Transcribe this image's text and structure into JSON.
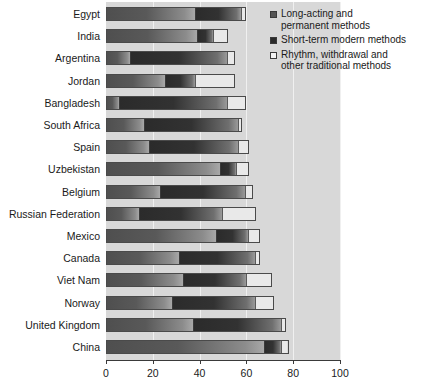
{
  "chart_data": {
    "type": "bar",
    "orientation": "horizontal",
    "stacked": true,
    "title": "",
    "xlabel": "",
    "ylabel": "",
    "xlim": [
      0,
      100
    ],
    "xticks": [
      0,
      20,
      40,
      60,
      80,
      100
    ],
    "xtick_labels": [
      "0",
      "20",
      "40",
      "60",
      "80",
      "100"
    ],
    "grid": true,
    "legend_position": "top-right",
    "categories": [
      "Egypt",
      "India",
      "Argentina",
      "Jordan",
      "Bangladesh",
      "South Africa",
      "Spain",
      "Uzbekistan",
      "Belgium",
      "Russian Federation",
      "Mexico",
      "Canada",
      "Viet Nam",
      "Norway",
      "United Kingdom",
      "China"
    ],
    "series": [
      {
        "name": "Long-acting and permanent methods",
        "color": "#555555",
        "values": [
          38,
          39,
          10,
          25,
          5,
          16,
          18,
          49,
          23,
          14,
          47,
          31,
          33,
          28,
          37,
          68
        ]
      },
      {
        "name": "Short-term modern methods",
        "color": "#2b2b2b",
        "values": [
          20,
          7,
          42,
          13,
          47,
          41,
          39,
          7,
          37,
          36,
          14,
          33,
          27,
          36,
          38,
          7
        ]
      },
      {
        "name": "Rhythm, withdrawal and other traditional methods",
        "color": "#f2f2f2",
        "values": [
          2,
          6,
          3,
          17,
          8,
          1,
          4,
          5,
          3,
          14,
          5,
          2,
          11,
          8,
          2,
          3
        ]
      }
    ],
    "totals": [
      60,
      52,
      55,
      55,
      60,
      58,
      61,
      61,
      63,
      64,
      66,
      66,
      71,
      72,
      77,
      78
    ]
  },
  "legend": {
    "items": [
      {
        "label": "Long-acting and\npermanent methods",
        "swatch": "swatch-long"
      },
      {
        "label": "Short-term modern methods",
        "swatch": "swatch-short"
      },
      {
        "label": "Rhythm, withdrawal and\nother traditional methods",
        "swatch": "swatch-trad"
      }
    ]
  }
}
